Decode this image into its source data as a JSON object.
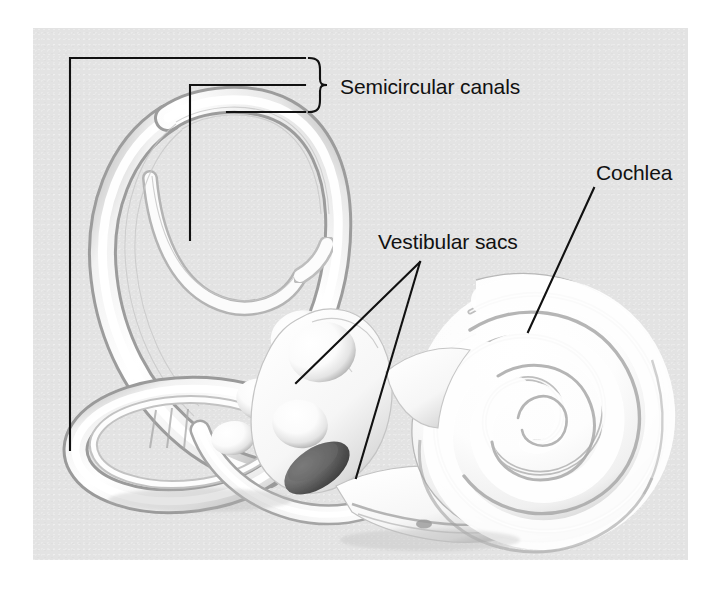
{
  "figure": {
    "kind": "anatomical-illustration",
    "background_color": "#e3e3e3",
    "page_color": "#ffffff",
    "line_color": "#111111",
    "structure_fill": "#ffffff",
    "shading_color": "#9a9a9a"
  },
  "labels": {
    "semicircular_canals": "Semicircular canals",
    "cochlea": "Cochlea",
    "vestibular_sacs": "Vestibular sacs"
  },
  "leader_lines": {
    "semicircular_canals": {
      "brace": "right-curly-brace",
      "brace_top_y": 58,
      "brace_bottom_y": 130,
      "lines": 3,
      "line_1": "long horizontal at y=58 from x=70 to x=305, with vertical drop at x=70 down to y=450",
      "line_2": "horizontal at y=85 from x=190 to x=305, with vertical drop at x=190 down to y=240",
      "line_3": "short horizontal at y=112 from x=227 to x=305"
    },
    "cochlea": {
      "from": [
        594,
        188
      ],
      "to": [
        528,
        332
      ]
    },
    "vestibular_sacs": {
      "apex": [
        420,
        262
      ],
      "branch_1_to": [
        296,
        383
      ],
      "branch_2_to": [
        356,
        478
      ]
    }
  },
  "anatomy_parts": [
    "anterior semicircular canal",
    "posterior semicircular canal",
    "lateral semicircular canal",
    "ampullae",
    "vestibule",
    "utricle",
    "saccule",
    "oval window",
    "round window",
    "cochlear spiral"
  ]
}
